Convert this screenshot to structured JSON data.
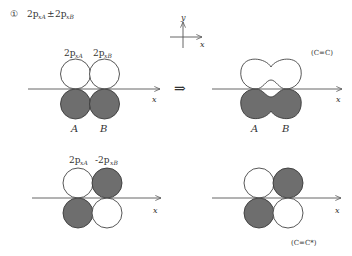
{
  "header": {
    "index_symbol": "①",
    "term1_base": "2p",
    "term1_sub": "xA",
    "operator": "±",
    "term2_base": "2p",
    "term2_sub": "xB"
  },
  "coord_ref": {
    "y_label": "y",
    "x_label": "x"
  },
  "implies_arrow": "⇒",
  "panels": {
    "top_left": {
      "label_left_base": "2p",
      "label_left_sub": "xA",
      "label_right_base": "2p",
      "label_right_sub": "xB",
      "atom_a": "A",
      "atom_b": "B",
      "axis_label": "x"
    },
    "top_right": {
      "atom_a": "A",
      "atom_b": "B",
      "axis_label": "x",
      "bond_tag": "(C=C)"
    },
    "bottom_left": {
      "label_left_base": "2p",
      "label_left_sub": "xA",
      "label_right_base": "-2p",
      "label_right_sub": "xB",
      "axis_label": "x"
    },
    "bottom_right": {
      "axis_label": "x",
      "bond_tag": "(C=C*)"
    }
  },
  "colors": {
    "filled_lobe": "#6e6e6e",
    "empty_lobe": "#ffffff",
    "line": "#444444"
  }
}
